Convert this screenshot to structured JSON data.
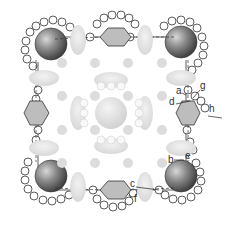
{
  "diagram": {
    "type": "crystal-structure-projection",
    "labels": [
      {
        "id": "a",
        "text": "a",
        "x": 176,
        "y": 93
      },
      {
        "id": "b",
        "text": "b",
        "x": 168,
        "y": 162
      },
      {
        "id": "c",
        "text": "c",
        "x": 130,
        "y": 186
      },
      {
        "id": "d",
        "text": "d",
        "x": 170,
        "y": 104
      },
      {
        "id": "e",
        "text": "e",
        "x": 185,
        "y": 158
      },
      {
        "id": "f",
        "text": "f",
        "x": 136,
        "y": 199
      },
      {
        "id": "g",
        "text": "g",
        "x": 201,
        "y": 88
      },
      {
        "id": "h",
        "text": "h",
        "x": 210,
        "y": 111
      }
    ],
    "colors": {
      "dark_sphere": "#5a5a5a",
      "light_blob": "#e3e3e3",
      "outline": "#333333",
      "small_circle_fill": "#ffffff"
    }
  }
}
